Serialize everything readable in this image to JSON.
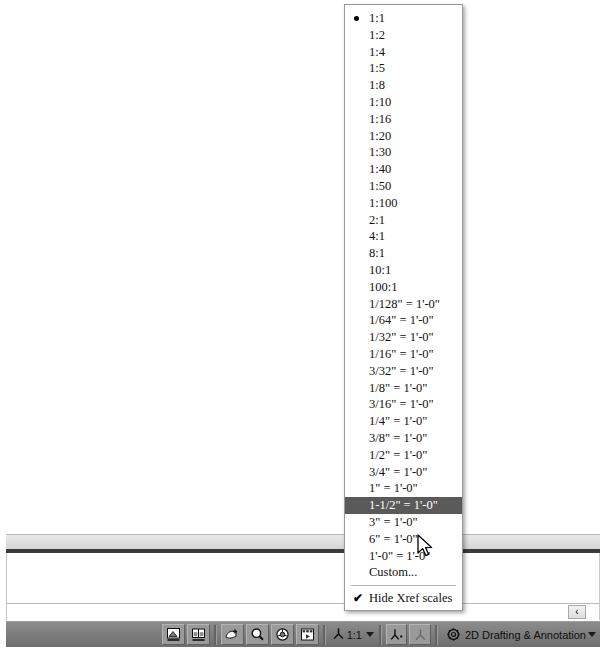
{
  "app": {
    "workspace_label": "2D Drafting & Annotation",
    "workspace_icon": "gear-icon"
  },
  "command_line": {
    "history_text": "",
    "input_value": "",
    "input_placeholder": "",
    "scroll_left_label": "‹"
  },
  "status_bar": {
    "annotation_scale_value": "1:1",
    "buttons": [
      {
        "name": "model-space-button",
        "icon": "model-space-icon"
      },
      {
        "name": "layout-space-button",
        "icon": "layout-space-icon"
      },
      {
        "name": "quick-view-layouts-button",
        "icon": "quick-view-layouts-icon"
      },
      {
        "name": "pan-realtime-button",
        "icon": "magnifier-icon"
      },
      {
        "name": "zoom-realtime-button",
        "icon": "steering-wheel-icon"
      },
      {
        "name": "showmotion-button",
        "icon": "showmotion-icon"
      }
    ],
    "annotation_visibility_icon": "annotation-visibility-icon",
    "annotation_autoscale_icon": "annotation-autoscale-icon"
  },
  "scale_menu": {
    "selected_index": 29,
    "checked_index": 0,
    "items": [
      {
        "label": "1:1"
      },
      {
        "label": "1:2"
      },
      {
        "label": "1:4"
      },
      {
        "label": "1:5"
      },
      {
        "label": "1:8"
      },
      {
        "label": "1:10"
      },
      {
        "label": "1:16"
      },
      {
        "label": "1:20"
      },
      {
        "label": "1:30"
      },
      {
        "label": "1:40"
      },
      {
        "label": "1:50"
      },
      {
        "label": "1:100"
      },
      {
        "label": "2:1"
      },
      {
        "label": "4:1"
      },
      {
        "label": "8:1"
      },
      {
        "label": "10:1"
      },
      {
        "label": "100:1"
      },
      {
        "label": "1/128\" = 1'-0\""
      },
      {
        "label": "1/64\" = 1'-0\""
      },
      {
        "label": "1/32\" = 1'-0\""
      },
      {
        "label": "1/16\" = 1'-0\""
      },
      {
        "label": "3/32\" = 1'-0\""
      },
      {
        "label": "1/8\" = 1'-0\""
      },
      {
        "label": "3/16\" = 1'-0\""
      },
      {
        "label": "1/4\" = 1'-0\""
      },
      {
        "label": "3/8\" = 1'-0\""
      },
      {
        "label": "1/2\" = 1'-0\""
      },
      {
        "label": "3/4\" = 1'-0\""
      },
      {
        "label": "1\" = 1'-0\""
      },
      {
        "label": "1-1/2\" = 1'-0\""
      },
      {
        "label": "3\" = 1'-0\""
      },
      {
        "label": "6\" = 1'-0\""
      },
      {
        "label": "1'-0\" = 1'-0\""
      },
      {
        "label": "Custom..."
      }
    ],
    "hide_xref_label": "Hide Xref scales",
    "hide_xref_checked": true,
    "check_glyph": "✔"
  },
  "colors": {
    "menu_highlight": "#5a5a5a",
    "status_bar_bg": "#7e7e7e",
    "canvas_bg": "#ffffff"
  }
}
